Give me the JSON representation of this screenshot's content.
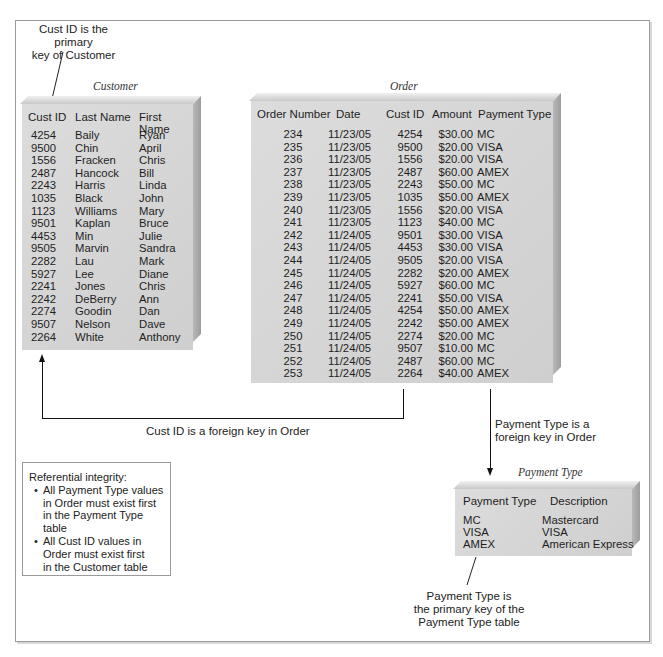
{
  "annotations": {
    "customer_pk": [
      "Cust ID is the primary",
      "key of Customer"
    ],
    "cust_fk": "Cust ID is a foreign key in Order",
    "payment_fk": [
      "Payment Type is a",
      "foreign key in Order"
    ],
    "payment_pk": [
      "Payment Type is",
      "the primary key of the",
      "Payment Type table"
    ]
  },
  "referential_integrity": {
    "title": "Referential integrity:",
    "bullets": [
      [
        "All Payment Type values",
        "in Order must exist first",
        "in the Payment Type table"
      ],
      [
        "All Cust ID values in",
        "Order must exist first",
        "in the Customer table"
      ]
    ]
  },
  "customer": {
    "caption": "Customer",
    "columns": [
      "Cust ID",
      "Last Name",
      "First Name"
    ],
    "rows": [
      [
        "4254",
        "Baily",
        "Ryan"
      ],
      [
        "9500",
        "Chin",
        "April"
      ],
      [
        "1556",
        "Fracken",
        "Chris"
      ],
      [
        "2487",
        "Hancock",
        "Bill"
      ],
      [
        "2243",
        "Harris",
        "Linda"
      ],
      [
        "1035",
        "Black",
        "John"
      ],
      [
        "1123",
        "Williams",
        "Mary"
      ],
      [
        "9501",
        "Kaplan",
        "Bruce"
      ],
      [
        "4453",
        "Min",
        "Julie"
      ],
      [
        "9505",
        "Marvin",
        "Sandra"
      ],
      [
        "2282",
        "Lau",
        "Mark"
      ],
      [
        "5927",
        "Lee",
        "Diane"
      ],
      [
        "2241",
        "Jones",
        "Chris"
      ],
      [
        "2242",
        "DeBerry",
        "Ann"
      ],
      [
        "2274",
        "Goodin",
        "Dan"
      ],
      [
        "9507",
        "Nelson",
        "Dave"
      ],
      [
        "2264",
        "White",
        "Anthony"
      ]
    ]
  },
  "order": {
    "caption": "Order",
    "columns": [
      "Order Number",
      "Date",
      "Cust ID",
      "Amount",
      "Payment Type"
    ],
    "rows": [
      [
        "234",
        "11/23/05",
        "4254",
        "$30.00",
        "MC"
      ],
      [
        "235",
        "11/23/05",
        "9500",
        "$20.00",
        "VISA"
      ],
      [
        "236",
        "11/23/05",
        "1556",
        "$20.00",
        "VISA"
      ],
      [
        "237",
        "11/23/05",
        "2487",
        "$60.00",
        "AMEX"
      ],
      [
        "238",
        "11/23/05",
        "2243",
        "$50.00",
        "MC"
      ],
      [
        "239",
        "11/23/05",
        "1035",
        "$50.00",
        "AMEX"
      ],
      [
        "240",
        "11/23/05",
        "1556",
        "$20.00",
        "VISA"
      ],
      [
        "241",
        "11/23/05",
        "1123",
        "$40.00",
        "MC"
      ],
      [
        "242",
        "11/24/05",
        "9501",
        "$30.00",
        "VISA"
      ],
      [
        "243",
        "11/24/05",
        "4453",
        "$30.00",
        "VISA"
      ],
      [
        "244",
        "11/24/05",
        "9505",
        "$20.00",
        "VISA"
      ],
      [
        "245",
        "11/24/05",
        "2282",
        "$20.00",
        "AMEX"
      ],
      [
        "246",
        "11/24/05",
        "5927",
        "$60.00",
        "MC"
      ],
      [
        "247",
        "11/24/05",
        "2241",
        "$50.00",
        "VISA"
      ],
      [
        "248",
        "11/24/05",
        "4254",
        "$50.00",
        "AMEX"
      ],
      [
        "249",
        "11/24/05",
        "2242",
        "$50.00",
        "AMEX"
      ],
      [
        "250",
        "11/24/05",
        "2274",
        "$20.00",
        "MC"
      ],
      [
        "251",
        "11/24/05",
        "9507",
        "$10.00",
        "MC"
      ],
      [
        "252",
        "11/24/05",
        "2487",
        "$60.00",
        "MC"
      ],
      [
        "253",
        "11/24/05",
        "2264",
        "$40.00",
        "AMEX"
      ]
    ]
  },
  "payment_type": {
    "caption": "Payment Type",
    "columns": [
      "Payment Type",
      "Description"
    ],
    "rows": [
      [
        "MC",
        "Mastercard"
      ],
      [
        "VISA",
        "VISA"
      ],
      [
        "AMEX",
        "American Express"
      ]
    ]
  }
}
